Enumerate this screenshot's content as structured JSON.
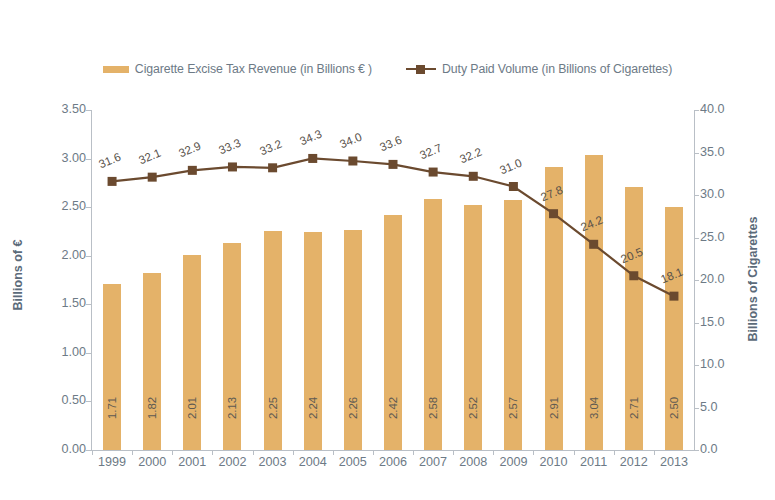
{
  "chart_data": {
    "type": "bar",
    "title": "",
    "subtitle": "",
    "xlabel": "",
    "ylabel": "Billions of €",
    "y2label": "Billions of Cigarettes",
    "categories": [
      "1999",
      "2000",
      "2001",
      "2002",
      "2003",
      "2004",
      "2005",
      "2006",
      "2007",
      "2008",
      "2009",
      "2010",
      "2011",
      "2012",
      "2013"
    ],
    "ylim": [
      0,
      3.5
    ],
    "y2lim": [
      0,
      40
    ],
    "yticks": [
      "0.00",
      "0.50",
      "1.00",
      "1.50",
      "2.00",
      "2.50",
      "3.00",
      "3.50"
    ],
    "ytick_values": [
      0,
      0.5,
      1.0,
      1.5,
      2.0,
      2.5,
      3.0,
      3.5
    ],
    "y2ticks": [
      "0.0",
      "5.0",
      "10.0",
      "15.0",
      "20.0",
      "25.0",
      "30.0",
      "35.0",
      "40.0"
    ],
    "y2tick_values": [
      0,
      5,
      10,
      15,
      20,
      25,
      30,
      35,
      40
    ],
    "grid": false,
    "legend_position": "top",
    "series": [
      {
        "name": "Cigarette Excise Tax Revenue  (in Billions € )",
        "type": "bar",
        "axis": "left",
        "color": "#e4b269",
        "values": [
          1.71,
          1.82,
          2.01,
          2.13,
          2.25,
          2.24,
          2.26,
          2.42,
          2.58,
          2.52,
          2.57,
          2.91,
          3.04,
          2.71,
          2.5
        ],
        "labels": [
          "1.71",
          "1.82",
          "2.01",
          "2.13",
          "2.25",
          "2.24",
          "2.26",
          "2.42",
          "2.58",
          "2.52",
          "2.57",
          "2.91",
          "3.04",
          "2.71",
          "2.50"
        ]
      },
      {
        "name": "Duty Paid Volume (in Billions of Cigarettes)",
        "type": "line",
        "axis": "right",
        "color": "#6b4a2f",
        "values": [
          31.6,
          32.1,
          32.9,
          33.3,
          33.2,
          34.3,
          34.0,
          33.6,
          32.7,
          32.2,
          31.0,
          27.8,
          24.2,
          20.5,
          18.1
        ],
        "labels": [
          "31.6",
          "32.1",
          "32.9",
          "33.3",
          "33.2",
          "34.3",
          "34.0",
          "33.6",
          "32.7",
          "32.2",
          "31.0",
          "27.8",
          "24.2",
          "20.5",
          "18.1"
        ]
      }
    ]
  },
  "legend": {
    "items": [
      {
        "label": "Cigarette Excise Tax Revenue  (in Billions € )",
        "marker": "bar-swatch",
        "color": "#e4b269"
      },
      {
        "label": "Duty Paid Volume (in Billions of Cigarettes)",
        "marker": "line-square-marker",
        "color": "#6b4a2f"
      }
    ]
  },
  "axes": {
    "left_title": "Billions of €",
    "right_title": "Billions of Cigarettes"
  },
  "colors": {
    "bar": "#e4b269",
    "line": "#6b4a2f",
    "axis": "#b9bfc6",
    "text": "#6d7a86",
    "background": "#ffffff"
  }
}
